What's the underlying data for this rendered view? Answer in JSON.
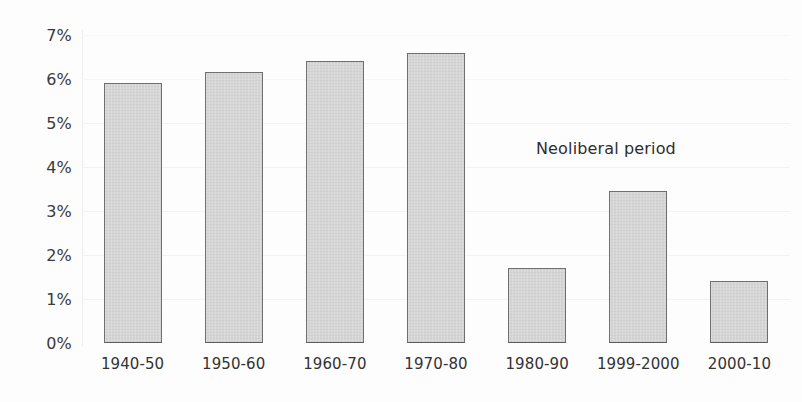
{
  "chart_data": {
    "type": "bar",
    "title": "",
    "subtitle": "",
    "xlabel": "",
    "ylabel": "",
    "categories": [
      "1940-50",
      "1950-60",
      "1960-70",
      "1970-80",
      "1980-90",
      "1999-2000",
      "2000-10"
    ],
    "values": [
      5.9,
      6.15,
      6.4,
      6.6,
      1.7,
      3.45,
      1.4
    ],
    "value_unit": "%",
    "ylim": [
      0,
      7
    ],
    "ytick_values": [
      0,
      1,
      2,
      3,
      4,
      5,
      6,
      7
    ],
    "ytick_labels": [
      "0%",
      "1%",
      "2%",
      "3%",
      "4%",
      "5%",
      "6%",
      "7%"
    ],
    "grid": true,
    "grid_axis": "y",
    "legend": false,
    "legend_position": "none",
    "annotations": [
      {
        "text": "Neoliberal period",
        "x_category_span": [
          "1980-90",
          "2000-10"
        ],
        "y_value": 4.4
      }
    ],
    "colors": {
      "bar_fill": "#d2d2d2",
      "bar_border": "#6f6f6f",
      "background": "#fdfdfd",
      "gridline": "#f2f2f2",
      "axis_line": "#ececec",
      "tick_label": "#3a3a3a",
      "annotation_text": "#2e2e2e"
    }
  }
}
